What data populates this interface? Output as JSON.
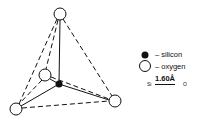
{
  "diagram": {
    "atoms": [
      {
        "id": "O-top",
        "element": "oxygen",
        "cx": 60,
        "cy": 14
      },
      {
        "id": "O-front",
        "element": "oxygen",
        "cx": 45,
        "cy": 75
      },
      {
        "id": "O-bottom-left",
        "element": "oxygen",
        "cx": 16,
        "cy": 109
      },
      {
        "id": "O-bottom-right",
        "element": "oxygen",
        "cx": 115,
        "cy": 101
      },
      {
        "id": "Si-center",
        "element": "silicon",
        "cx": 59,
        "cy": 84
      }
    ],
    "colors": {
      "line": "#111111",
      "silicon": "#111111",
      "oxygen_fill": "#ffffff"
    }
  },
  "legend": {
    "silicon_label": "– silicon",
    "oxygen_label": "– oxygen",
    "bond_left": "Si",
    "bond_length": "1.60Å",
    "bond_right": "O"
  }
}
